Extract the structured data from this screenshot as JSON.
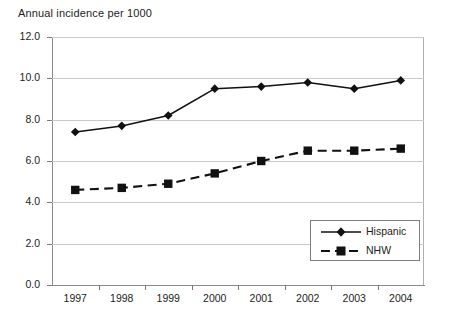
{
  "chart_data": {
    "type": "line",
    "title": "Annual incidence per 1000",
    "xlabel": "",
    "ylabel": "",
    "categories": [
      "1997",
      "1998",
      "1999",
      "2000",
      "2001",
      "2002",
      "2003",
      "2004"
    ],
    "series": [
      {
        "name": "Hispanic",
        "marker": "diamond",
        "line_style": "solid",
        "color": "#111111",
        "values": [
          7.4,
          7.7,
          8.2,
          9.5,
          9.6,
          9.8,
          9.5,
          9.9
        ]
      },
      {
        "name": "NHW",
        "marker": "square",
        "line_style": "dashed",
        "color": "#111111",
        "values": [
          4.6,
          4.7,
          4.9,
          5.4,
          6.0,
          6.5,
          6.5,
          6.6
        ]
      }
    ],
    "ylim": [
      0.0,
      12.0
    ],
    "y_ticks": [
      "0.0",
      "2.0",
      "4.0",
      "6.0",
      "8.0",
      "10.0",
      "12.0"
    ],
    "y_tick_values": [
      0.0,
      2.0,
      4.0,
      6.0,
      8.0,
      10.0,
      12.0
    ],
    "grid": true,
    "grid_color": "#c9c9c9",
    "legend_position": "inside-bottom-right",
    "legend_entries": [
      "Hispanic",
      "NHW"
    ],
    "axis_color": "#8a8a8a",
    "background": "#ffffff"
  }
}
